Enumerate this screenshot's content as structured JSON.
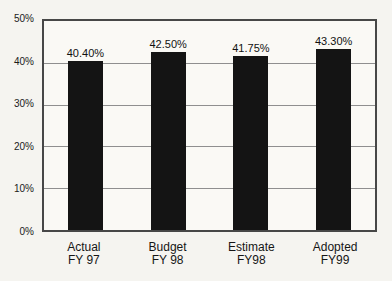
{
  "chart_data": {
    "type": "bar",
    "title": "",
    "categories": [
      "Actual FY 97",
      "Budget FY 98",
      "Estimate FY98",
      "Adopted FY99"
    ],
    "category_lines": [
      [
        "Actual",
        "FY 97"
      ],
      [
        "Budget",
        "FY 98"
      ],
      [
        "Estimate",
        "FY98"
      ],
      [
        "Adopted",
        "FY99"
      ]
    ],
    "values": [
      40.4,
      42.5,
      41.75,
      43.3
    ],
    "value_labels": [
      "40.40%",
      "42.50%",
      "41.75%",
      "43.30%"
    ],
    "ylim": [
      0,
      50
    ],
    "y_ticks": [
      {
        "value": 0,
        "label": "0%"
      },
      {
        "value": 10,
        "label": "10%"
      },
      {
        "value": 20,
        "label": "20%"
      },
      {
        "value": 30,
        "label": "30%"
      },
      {
        "value": 40,
        "label": "40%"
      },
      {
        "value": 50,
        "label": "50%"
      }
    ],
    "grid": true,
    "legend": "none",
    "colors": {
      "bar": "#141414",
      "grid": "#8f8f8f",
      "plot_border": "#474747",
      "background": "#f5f4f0",
      "plot_background": "#faf9f5"
    }
  }
}
